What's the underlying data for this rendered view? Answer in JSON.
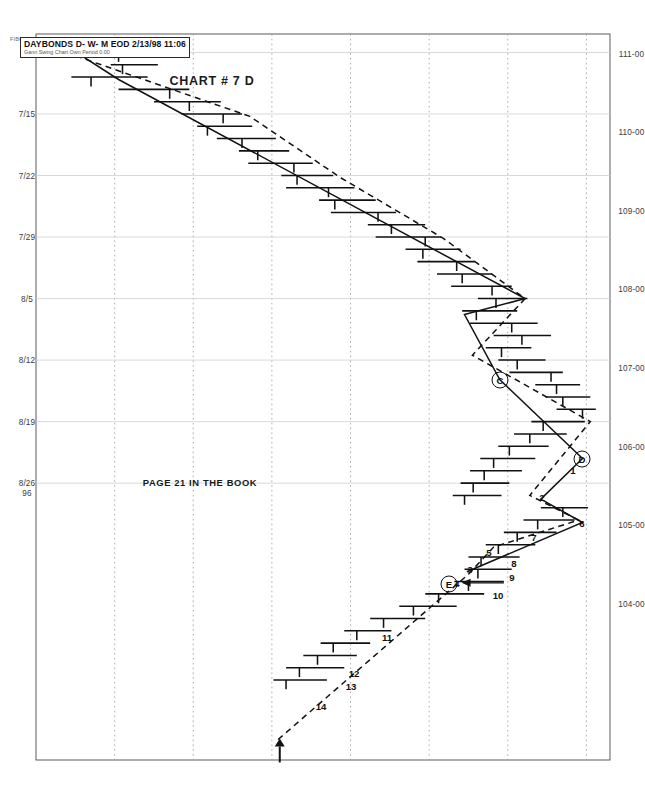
{
  "meta": {
    "brand": "FIBONACCI TRADER (c) Robert Krausz",
    "symbol_line": "DAYBONDS D- W- M EOD  2/13/98 11:06",
    "symbol_sub": "Gann Swing Chart Own Period 0.00"
  },
  "annotations": {
    "title": "CHART # 7   D",
    "page_note": "PAGE 21 IN THE BOOK",
    "minor_valley": "MINOR VALLEY",
    "pivots": [
      {
        "label": "D",
        "x_index": 34.0,
        "price": 110.95
      },
      {
        "label": "C",
        "x_index": 27.6,
        "price": 109.9
      },
      {
        "label": "E",
        "x_index": 44.2,
        "price": 109.25
      }
    ],
    "swing_numbers": [
      {
        "n": "1",
        "x_index": 34.9,
        "price": 110.83
      },
      {
        "n": "2",
        "x_index": 37.1,
        "price": 110.43
      },
      {
        "n": "3",
        "x_index": 43.0,
        "price": 109.52
      },
      {
        "n": "4",
        "x_index": 44.1,
        "price": 109.36
      },
      {
        "n": "5",
        "x_index": 41.6,
        "price": 109.76
      },
      {
        "n": "6",
        "x_index": 39.2,
        "price": 110.95
      },
      {
        "n": "7",
        "x_index": 40.4,
        "price": 110.33
      },
      {
        "n": "8",
        "x_index": 42.5,
        "price": 110.08
      },
      {
        "n": "9",
        "x_index": 43.6,
        "price": 110.05
      },
      {
        "n": "10",
        "x_index": 45.1,
        "price": 109.88
      },
      {
        "n": "11",
        "x_index": 48.5,
        "price": 108.46
      },
      {
        "n": "12",
        "x_index": 51.4,
        "price": 108.05
      },
      {
        "n": "13",
        "x_index": 52.5,
        "price": 108.01
      },
      {
        "n": "14",
        "x_index": 54.1,
        "price": 107.63
      }
    ],
    "arrows": [
      {
        "kind": "down-arrow",
        "x_index": 44.1,
        "from_price": 109.95,
        "to_price": 109.45
      },
      {
        "kind": "left-arrow",
        "x_index": 57.4,
        "price": 107.1
      }
    ]
  },
  "chart_data": {
    "type": "ohlc-bar",
    "title": "DAYBONDS D- W- M EOD",
    "xlabel": "",
    "ylabel": "Price (32nds)",
    "grid": true,
    "legend": "none",
    "orientation": "rotated-90-cw",
    "ylim": [
      104.0,
      111.3
    ],
    "yticks": [
      "111-00",
      "110-00",
      "109-00",
      "108-00",
      "107-00",
      "106-00",
      "105-00",
      "104-00"
    ],
    "ytick_values": [
      111.0,
      110.0,
      109.0,
      108.0,
      107.0,
      106.0,
      105.0,
      104.0
    ],
    "xticks": [
      "7/8",
      "7/15",
      "7/22",
      "7/29",
      "8/5",
      "8/12",
      "8/19",
      "8/26"
    ],
    "xtick_indices": [
      1,
      6,
      11,
      16,
      21,
      26,
      31,
      36
    ],
    "year_label": "96",
    "bars": [
      {
        "i": 0,
        "h": 105.02,
        "l": 104.35,
        "c": 104.6
      },
      {
        "i": 1,
        "h": 105.28,
        "l": 104.55,
        "c": 105.05
      },
      {
        "i": 2,
        "h": 105.55,
        "l": 104.95,
        "c": 105.1
      },
      {
        "i": 3,
        "h": 105.42,
        "l": 104.45,
        "c": 104.7
      },
      {
        "i": 4,
        "h": 105.95,
        "l": 105.05,
        "c": 105.7
      },
      {
        "i": 5,
        "h": 106.35,
        "l": 105.5,
        "c": 105.95
      },
      {
        "i": 6,
        "h": 106.62,
        "l": 105.85,
        "c": 106.38
      },
      {
        "i": 7,
        "h": 106.75,
        "l": 106.05,
        "c": 106.18
      },
      {
        "i": 8,
        "h": 107.05,
        "l": 106.3,
        "c": 106.62
      },
      {
        "i": 9,
        "h": 107.22,
        "l": 106.58,
        "c": 106.82
      },
      {
        "i": 10,
        "h": 107.52,
        "l": 106.7,
        "c": 107.28
      },
      {
        "i": 11,
        "h": 107.78,
        "l": 107.12,
        "c": 107.32
      },
      {
        "i": 12,
        "h": 108.05,
        "l": 107.18,
        "c": 107.72
      },
      {
        "i": 13,
        "h": 108.32,
        "l": 107.6,
        "c": 107.8
      },
      {
        "i": 14,
        "h": 108.58,
        "l": 107.75,
        "c": 108.35
      },
      {
        "i": 15,
        "h": 108.95,
        "l": 108.22,
        "c": 108.52
      },
      {
        "i": 16,
        "h": 109.15,
        "l": 108.32,
        "c": 108.95
      },
      {
        "i": 17,
        "h": 109.4,
        "l": 108.7,
        "c": 108.92
      },
      {
        "i": 18,
        "h": 109.58,
        "l": 108.85,
        "c": 109.35
      },
      {
        "i": 19,
        "h": 109.8,
        "l": 109.1,
        "c": 109.42
      },
      {
        "i": 20,
        "h": 110.05,
        "l": 109.28,
        "c": 109.8
      },
      {
        "i": 21,
        "h": 110.25,
        "l": 109.62,
        "c": 109.85
      },
      {
        "i": 22,
        "h": 110.12,
        "l": 109.42,
        "c": 109.6
      },
      {
        "i": 23,
        "h": 110.38,
        "l": 109.52,
        "c": 110.05
      },
      {
        "i": 24,
        "h": 110.55,
        "l": 109.82,
        "c": 110.18
      },
      {
        "i": 25,
        "h": 110.3,
        "l": 109.72,
        "c": 109.92
      },
      {
        "i": 26,
        "h": 110.48,
        "l": 109.88,
        "c": 110.12
      },
      {
        "i": 27,
        "h": 110.7,
        "l": 110.02,
        "c": 110.55
      },
      {
        "i": 28,
        "h": 110.92,
        "l": 110.35,
        "c": 110.62
      },
      {
        "i": 29,
        "h": 111.05,
        "l": 110.48,
        "c": 110.7
      },
      {
        "i": 30,
        "h": 111.12,
        "l": 110.62,
        "c": 110.95
      },
      {
        "i": 31,
        "h": 110.98,
        "l": 110.3,
        "c": 110.45
      },
      {
        "i": 32,
        "h": 110.75,
        "l": 110.08,
        "c": 110.28
      },
      {
        "i": 33,
        "h": 110.52,
        "l": 109.88,
        "c": 110.02
      },
      {
        "i": 34,
        "h": 110.35,
        "l": 109.65,
        "c": 109.82
      },
      {
        "i": 35,
        "h": 110.18,
        "l": 109.52,
        "c": 109.7
      },
      {
        "i": 36,
        "h": 110.02,
        "l": 109.4,
        "c": 109.56
      },
      {
        "i": 37,
        "h": 109.92,
        "l": 109.3,
        "c": 109.45
      },
      {
        "i": 38,
        "h": 111.02,
        "l": 110.42,
        "c": 110.7
      },
      {
        "i": 39,
        "h": 110.85,
        "l": 110.2,
        "c": 110.38
      },
      {
        "i": 40,
        "h": 110.62,
        "l": 109.95,
        "c": 110.12
      },
      {
        "i": 41,
        "h": 110.35,
        "l": 109.72,
        "c": 109.88
      },
      {
        "i": 42,
        "h": 110.15,
        "l": 109.5,
        "c": 109.66
      },
      {
        "i": 43,
        "h": 110.05,
        "l": 109.45,
        "c": 109.62
      },
      {
        "i": 44,
        "h": 109.95,
        "l": 109.32,
        "c": 109.5
      },
      {
        "i": 45,
        "h": 109.7,
        "l": 108.95,
        "c": 109.12
      },
      {
        "i": 46,
        "h": 109.35,
        "l": 108.62,
        "c": 108.8
      },
      {
        "i": 47,
        "h": 108.95,
        "l": 108.25,
        "c": 108.42
      },
      {
        "i": 48,
        "h": 108.52,
        "l": 107.92,
        "c": 108.08
      },
      {
        "i": 49,
        "h": 108.25,
        "l": 107.62,
        "c": 107.78
      },
      {
        "i": 50,
        "h": 108.08,
        "l": 107.4,
        "c": 107.58
      },
      {
        "i": 51,
        "h": 107.92,
        "l": 107.18,
        "c": 107.35
      },
      {
        "i": 52,
        "h": 107.7,
        "l": 107.02,
        "c": 107.18
      }
    ],
    "swing_line_solid": [
      {
        "x_index": 0.2,
        "price": 104.32
      },
      {
        "x_index": 3.2,
        "price": 105.05
      },
      {
        "x_index": 21.0,
        "price": 110.22
      },
      {
        "x_index": 22.3,
        "price": 109.45
      },
      {
        "x_index": 27.6,
        "price": 109.9
      },
      {
        "x_index": 34.0,
        "price": 110.95
      },
      {
        "x_index": 37.3,
        "price": 110.42
      },
      {
        "x_index": 39.2,
        "price": 110.95
      },
      {
        "x_index": 43.2,
        "price": 109.48
      }
    ],
    "swing_line_dashed": [
      {
        "x_index": 1.0,
        "price": 104.38
      },
      {
        "x_index": 6.2,
        "price": 106.72
      },
      {
        "x_index": 11.2,
        "price": 107.88
      },
      {
        "x_index": 16.1,
        "price": 109.18
      },
      {
        "x_index": 21.0,
        "price": 110.22
      },
      {
        "x_index": 25.6,
        "price": 109.55
      },
      {
        "x_index": 31.0,
        "price": 111.05
      },
      {
        "x_index": 37.0,
        "price": 110.28
      },
      {
        "x_index": 39.0,
        "price": 110.9
      },
      {
        "x_index": 41.2,
        "price": 109.82
      },
      {
        "x_index": 43.4,
        "price": 109.5
      },
      {
        "x_index": 57.0,
        "price": 107.05
      }
    ]
  }
}
